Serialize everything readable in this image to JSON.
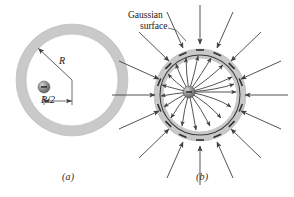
{
  "figure": {
    "type": "physics-diagram",
    "background_color": "#ffffff",
    "shell_fill": "#c9c9c9",
    "shell_stroke": "#b0b0b0",
    "gaussian_stroke": "#3a3a3a",
    "field_line_color": "#4a4a4a",
    "charge_color": "#8a8a8a"
  },
  "panel_a": {
    "caption": "(a)",
    "radius_label": "R",
    "offset_label": "R/2",
    "shell": {
      "center_x": 72,
      "center_y": 80,
      "outer_radius": 56,
      "inner_radius": 46
    },
    "charge": {
      "x": 44,
      "y": 87,
      "radius": 6
    }
  },
  "panel_b": {
    "caption": "(b)",
    "annotation_line1": "Gaussian",
    "annotation_line2": "surface",
    "shell": {
      "center_x": 200,
      "center_y": 95,
      "outer_radius": 46,
      "inner_radius": 37
    },
    "gaussian_surface": {
      "center_x": 200,
      "center_y": 95,
      "radius": 40
    },
    "charge": {
      "x": 189,
      "y": 92,
      "radius": 6
    },
    "inner_field_line_count": 18,
    "outer_field_arrow_count": 16,
    "inner_field_direction": "outward-from-charge",
    "outer_field_direction": "inward-toward-shell"
  }
}
